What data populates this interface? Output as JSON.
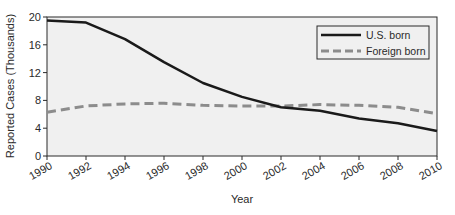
{
  "chart_data": {
    "type": "line",
    "title": "",
    "xlabel": "Year",
    "ylabel": "Reported Cases (Thousands)",
    "x": [
      1990,
      1992,
      1994,
      1996,
      1998,
      2000,
      2002,
      2004,
      2006,
      2008,
      2010
    ],
    "xticks": [
      "1990",
      "1992",
      "1994",
      "1996",
      "1998",
      "2000",
      "2002",
      "2004",
      "2006",
      "2008",
      "2010"
    ],
    "yticks": [
      "0",
      "4",
      "8",
      "12",
      "16",
      "20"
    ],
    "ylim": [
      0,
      20
    ],
    "xlim": [
      1990,
      2010
    ],
    "grid": false,
    "legend_position": "upper right",
    "series": [
      {
        "name": "U.S. born",
        "style": "solid",
        "color": "#1a1a1a",
        "values": [
          19.5,
          19.2,
          16.8,
          13.5,
          10.5,
          8.5,
          7.0,
          6.5,
          5.4,
          4.7,
          3.6
        ]
      },
      {
        "name": "Foreign born",
        "style": "dashed",
        "color": "#8c8c8c",
        "values": [
          6.3,
          7.2,
          7.5,
          7.6,
          7.3,
          7.2,
          7.2,
          7.4,
          7.3,
          7.0,
          6.1
        ]
      }
    ]
  },
  "legend": {
    "items": [
      {
        "label": "U.S. born"
      },
      {
        "label": "Foreign born"
      }
    ]
  },
  "colors": {
    "plot_background": "#f0f0f0",
    "axis": "#2a2a2a"
  }
}
